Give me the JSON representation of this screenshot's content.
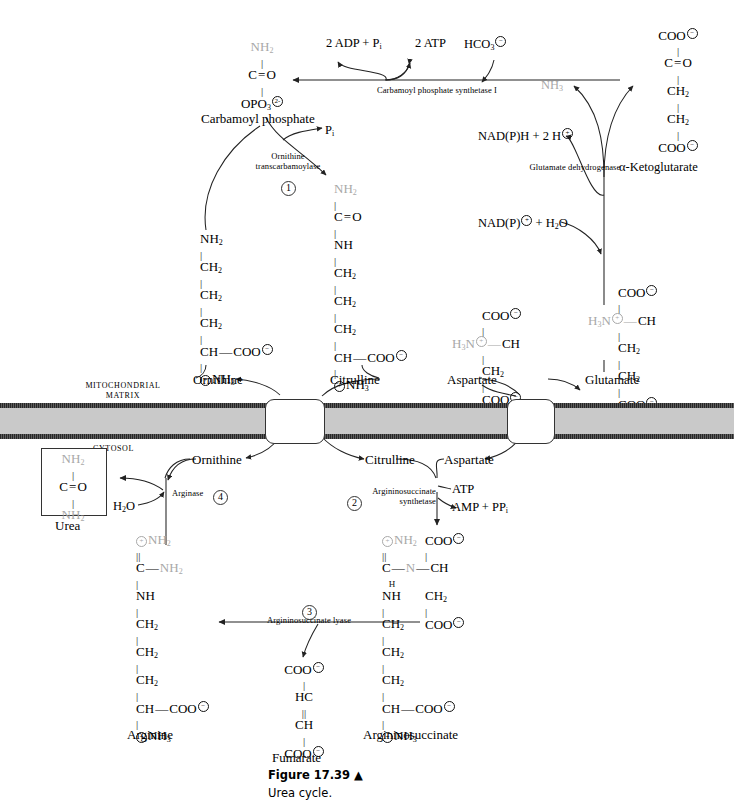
{
  "figure": {
    "number": "Figure 17.39 ▲",
    "caption": "Urea cycle."
  },
  "compartments": {
    "matrix_line1": "MITOCHONDRIAL",
    "matrix_line2": "MATRIX",
    "cytosol": "CYTOSOL"
  },
  "enzymes": [
    {
      "id": "cps1",
      "name": "Carbamoyl phosphate synthetase I",
      "step": ""
    },
    {
      "id": "otc",
      "name_line1": "Ornithine",
      "name_line2": "transcarbamoylase",
      "step": "1"
    },
    {
      "id": "gdh",
      "name": "Glutamate dehydrogenase",
      "step": ""
    },
    {
      "id": "ass",
      "name_line1": "Argininosuccinate",
      "name_line2": "synthetase",
      "step": "2"
    },
    {
      "id": "asl",
      "name": "Argininosuccinate lyase",
      "step": "3"
    },
    {
      "id": "arg",
      "name": "Arginase",
      "step": "4"
    }
  ],
  "cofactors": {
    "adp_pi": "2 ADP + P",
    "adp_pi_sub": "i",
    "atp": "2 ATP",
    "bicarbonate": "HCO",
    "bicarbonate_sub": "3",
    "bicarbonate_charge": "−",
    "ammonia": "NH",
    "ammonia_sub": "3",
    "nadph": "NAD(P)H + 2 H",
    "nadph_charge": "+",
    "nadp_h2o": "NAD(P)",
    "nadp_h2o_charge": "+",
    "nadp_h2o_tail": " + H",
    "nadp_h2o_tail_sub": "2",
    "nadp_h2o_tail_end": "O",
    "pi_released": "P",
    "pi_released_sub": "i",
    "atp2": "ATP",
    "amp_ppi": "AMP + PP",
    "amp_ppi_sub": "i",
    "water": "H",
    "water_sub": "2",
    "water_end": "O"
  },
  "metabolites": {
    "carbamoyl_phosphate": "Carbamoyl phosphate",
    "ornithine_matrix": "Ornithine",
    "citrulline_matrix": "Citrulline",
    "aspartate_matrix": "Aspartate",
    "glutamate_matrix": "Glutamate",
    "ketoglutarate": "α-Ketoglutarate",
    "ornithine_cytosol": "Ornithine",
    "citrulline_cytosol": "Citrulline",
    "aspartate_cytosol": "Aspartate",
    "urea": "Urea",
    "arginine": "Arginine",
    "fumarate": "Fumarate",
    "argininosuccinate": "Argininosuccinate"
  },
  "structures": {
    "carbamoyl_phosphate": {
      "name": "Carbamoyl phosphate",
      "rows": [
        "NH2",
        "C=O",
        "OPO3 2-"
      ]
    },
    "ketoglutarate": {
      "name": "α-Ketoglutarate",
      "rows": [
        "COO-",
        "C=O",
        "CH2",
        "CH2",
        "COO-"
      ]
    },
    "citrulline": {
      "name": "Citrulline",
      "rows": [
        "NH2",
        "C=O",
        "NH",
        "CH2",
        "CH2",
        "CH2",
        "CH-COO-",
        "+NH3"
      ]
    },
    "ornithine": {
      "name": "Ornithine",
      "rows": [
        "NH2",
        "CH2",
        "CH2",
        "CH2",
        "CH-COO-",
        "+NH3"
      ]
    },
    "aspartate": {
      "name": "Aspartate",
      "rows": [
        "COO-",
        "+H3N-CH",
        "CH2",
        "COO-"
      ]
    },
    "glutamate": {
      "name": "Glutamate",
      "rows": [
        "COO-",
        "+H3N-CH",
        "CH2",
        "CH2",
        "COO-"
      ]
    },
    "urea": {
      "name": "Urea",
      "rows": [
        "NH2",
        "C=O",
        "NH2"
      ]
    },
    "arginine": {
      "name": "Arginine",
      "rows": [
        "+NH2",
        "C-NH2",
        "NH",
        "CH2",
        "CH2",
        "CH2",
        "CH-COO-",
        "+NH3"
      ]
    },
    "fumarate": {
      "name": "Fumarate",
      "rows": [
        "COO-",
        "HC",
        "CH",
        "COO-"
      ]
    },
    "argininosuccinate": {
      "name": "Argininosuccinate",
      "rows": [
        "+NH2",
        "C-N(H)-CH",
        "NH",
        "CH2",
        "CH2",
        "CH2",
        "CH-COO-",
        "+NH3"
      ],
      "side_rows": [
        "COO-",
        "CH2",
        "COO-"
      ]
    }
  },
  "colors": {
    "nitrogen_highlight": "#a8a8a8",
    "membrane_core": "#c9c9c9",
    "membrane_edge": "#5a5a5a",
    "ink": "#000000"
  }
}
